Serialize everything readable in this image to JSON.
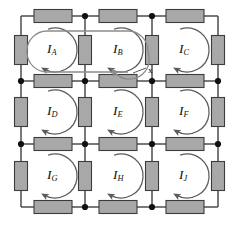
{
  "figure": {
    "type": "circuit-diagram",
    "colors": {
      "wire": "#4d4d4d",
      "resistor_fill": "#a8a8a8",
      "resistor_stroke": "#3c3c3c",
      "node": "#111111",
      "loop_arrow": "#5a5a5a",
      "superloop": "#8c8c8c",
      "background": "#ffffff"
    }
  },
  "mesh_currents": [
    {
      "id": "IA",
      "symbol": "I",
      "subscript": "A",
      "x": 55,
      "y": 50,
      "row": 1,
      "col": 1
    },
    {
      "id": "IB",
      "symbol": "I",
      "subscript": "B",
      "x": 121,
      "y": 50,
      "row": 1,
      "col": 2
    },
    {
      "id": "IC",
      "symbol": "I",
      "subscript": "C",
      "x": 187,
      "y": 50,
      "row": 1,
      "col": 3
    },
    {
      "id": "ID",
      "symbol": "I",
      "subscript": "D",
      "x": 55,
      "y": 112,
      "row": 2,
      "col": 1
    },
    {
      "id": "IE",
      "symbol": "I",
      "subscript": "E",
      "x": 121,
      "y": 112,
      "row": 2,
      "col": 2
    },
    {
      "id": "IF",
      "symbol": "I",
      "subscript": "F",
      "x": 187,
      "y": 112,
      "row": 2,
      "col": 3
    },
    {
      "id": "IG",
      "symbol": "I",
      "subscript": "G",
      "x": 55,
      "y": 176,
      "row": 3,
      "col": 1
    },
    {
      "id": "IH",
      "symbol": "I",
      "subscript": "H",
      "x": 121,
      "y": 176,
      "row": 3,
      "col": 2
    },
    {
      "id": "IJ",
      "symbol": "I",
      "subscript": "J",
      "x": 187,
      "y": 176,
      "row": 3,
      "col": 3
    }
  ],
  "annotations": [
    {
      "id": "x-label",
      "text": "x",
      "x": 148,
      "y": 70
    }
  ],
  "grid": {
    "x_lines": [
      21,
      85,
      152,
      218
    ],
    "y_lines": [
      16,
      81,
      144,
      207
    ],
    "rows": 3,
    "cols": 3
  },
  "nodes": [
    {
      "x": 85,
      "y": 16
    },
    {
      "x": 152,
      "y": 16
    },
    {
      "x": 21,
      "y": 81
    },
    {
      "x": 85,
      "y": 81
    },
    {
      "x": 152,
      "y": 81
    },
    {
      "x": 218,
      "y": 81
    },
    {
      "x": 21,
      "y": 144
    },
    {
      "x": 85,
      "y": 144
    },
    {
      "x": 152,
      "y": 144
    },
    {
      "x": 218,
      "y": 144
    },
    {
      "x": 85,
      "y": 207
    },
    {
      "x": 152,
      "y": 207
    }
  ],
  "resistors": {
    "horizontal": [
      {
        "cx": 53,
        "cy": 16
      },
      {
        "cx": 118,
        "cy": 16
      },
      {
        "cx": 185,
        "cy": 16
      },
      {
        "cx": 53,
        "cy": 81
      },
      {
        "cx": 118,
        "cy": 81
      },
      {
        "cx": 185,
        "cy": 81
      },
      {
        "cx": 53,
        "cy": 144
      },
      {
        "cx": 118,
        "cy": 144
      },
      {
        "cx": 185,
        "cy": 144
      },
      {
        "cx": 53,
        "cy": 207
      },
      {
        "cx": 118,
        "cy": 207
      },
      {
        "cx": 185,
        "cy": 207
      }
    ],
    "vertical": [
      {
        "cx": 21,
        "cy": 50
      },
      {
        "cx": 85,
        "cy": 50
      },
      {
        "cx": 152,
        "cy": 50
      },
      {
        "cx": 218,
        "cy": 50
      },
      {
        "cx": 21,
        "cy": 112
      },
      {
        "cx": 85,
        "cy": 112
      },
      {
        "cx": 152,
        "cy": 112
      },
      {
        "cx": 218,
        "cy": 112
      },
      {
        "cx": 21,
        "cy": 176
      },
      {
        "cx": 85,
        "cy": 176
      },
      {
        "cx": 152,
        "cy": 176
      },
      {
        "cx": 218,
        "cy": 176
      }
    ],
    "size": {
      "long": 38,
      "short": 13
    }
  },
  "superloop": {
    "x": 27,
    "y": 31,
    "width": 121,
    "height": 41,
    "radius": 20
  }
}
